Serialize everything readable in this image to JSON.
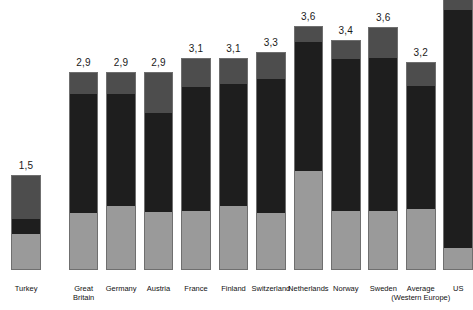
{
  "chart_data": {
    "type": "bar",
    "subtype": "stacked-bar",
    "title": "",
    "subtitle": "",
    "xlabel": "",
    "ylabel": "",
    "grid": false,
    "legend": false,
    "decimal_separator": ",",
    "categories": [
      "Turkey",
      "Great Britain",
      "Germany",
      "Austria",
      "France",
      "Finland",
      "Switzerland",
      "Netherlands",
      "Norway",
      "Sweden",
      "Average (Western Europe)",
      "US"
    ],
    "series": [
      {
        "name": "bottom-segment",
        "color": "#9a9a9a",
        "values": [
          0.37,
          0.58,
          0.65,
          0.59,
          0.6,
          0.65,
          0.58,
          1.0,
          0.6,
          0.59,
          0.61,
          0.22
        ]
      },
      {
        "name": "middle-segment",
        "color": "#1e1e1e",
        "values": [
          0.15,
          1.19,
          1.12,
          0.97,
          1.3,
          1.23,
          1.34,
          1.29,
          1.35,
          1.41,
          1.21,
          3.5
        ]
      },
      {
        "name": "top-segment",
        "color": "#4d4d4d",
        "values": [
          0.43,
          0.23,
          0.23,
          0.4,
          0.3,
          0.27,
          0.26,
          0.15,
          0.18,
          0.3,
          0.22,
          0.1
        ]
      }
    ],
    "totals": [
      1.5,
      2.9,
      2.9,
      2.9,
      3.1,
      3.1,
      3.3,
      3.6,
      3.4,
      3.6,
      3.2,
      null
    ],
    "value_labels": [
      "1,5",
      "2,9",
      "2,9",
      "2,9",
      "3,1",
      "3,1",
      "3,3",
      "3,6",
      "3,4",
      "3,6",
      "3,2",
      ""
    ]
  },
  "bars": [
    {
      "key": "turkey",
      "label_line1": "Turkey",
      "label_line2": "",
      "value": "1,5",
      "left": 13,
      "width": 34,
      "top": 175,
      "bottom": 270,
      "seg_top_h": 43,
      "seg_mid_h": 15,
      "seg_bot_h": 37,
      "cut": false
    },
    {
      "key": "great-britain",
      "label_line1": "Great",
      "label_line2": "Britain",
      "value": "2,9",
      "left": 79,
      "width": 34,
      "top": 72,
      "bottom": 270,
      "seg_top_h": 21,
      "seg_mid_h": 119,
      "seg_bot_h": 58,
      "cut": false
    },
    {
      "key": "germany",
      "label_line1": "Germany",
      "label_line2": "",
      "value": "2,9",
      "left": 122,
      "width": 34,
      "top": 72,
      "bottom": 270,
      "seg_top_h": 21,
      "seg_mid_h": 112,
      "seg_bot_h": 65,
      "cut": false
    },
    {
      "key": "austria",
      "label_line1": "Austria",
      "label_line2": "",
      "value": "2,9",
      "left": 165,
      "width": 34,
      "top": 72,
      "bottom": 270,
      "seg_top_h": 40,
      "seg_mid_h": 99,
      "seg_bot_h": 59,
      "cut": false
    },
    {
      "key": "france",
      "label_line1": "France",
      "label_line2": "",
      "value": "3,1",
      "left": 208,
      "width": 34,
      "top": 58,
      "bottom": 270,
      "seg_top_h": 28,
      "seg_mid_h": 124,
      "seg_bot_h": 60,
      "cut": false
    },
    {
      "key": "finland",
      "label_line1": "Finland",
      "label_line2": "",
      "value": "3,1",
      "left": 251,
      "width": 34,
      "top": 58,
      "bottom": 270,
      "seg_top_h": 25,
      "seg_mid_h": 122,
      "seg_bot_h": 65,
      "cut": false
    },
    {
      "key": "switzerland",
      "label_line1": "Switzerland",
      "label_line2": "",
      "value": "3,3",
      "left": 294,
      "width": 34,
      "top": 52,
      "bottom": 270,
      "seg_top_h": 26,
      "seg_mid_h": 134,
      "seg_bot_h": 58,
      "cut": false
    },
    {
      "key": "netherlands",
      "label_line1": "Netherlands",
      "label_line2": "",
      "value": "3,6",
      "left": 337,
      "width": 34,
      "top": 26,
      "bottom": 270,
      "seg_top_h": 15,
      "seg_mid_h": 129,
      "seg_bot_h": 100,
      "cut": false
    },
    {
      "key": "norway",
      "label_line1": "Norway",
      "label_line2": "",
      "value": "3,4",
      "left": 380,
      "width": 34,
      "top": 40,
      "bottom": 270,
      "seg_top_h": 18,
      "seg_mid_h": 152,
      "seg_bot_h": 60,
      "cut": false
    },
    {
      "key": "sweden",
      "label_line1": "Sweden",
      "label_line2": "",
      "value": "3,6",
      "left": 423,
      "width": 34,
      "top": 27,
      "bottom": 270,
      "seg_top_h": 30,
      "seg_mid_h": 153,
      "seg_bot_h": 60,
      "cut": false
    },
    {
      "key": "average-western-europe",
      "label_line1": "Average",
      "label_line2": "(Western Europe)",
      "value": "3,2",
      "left": 466,
      "width": 34,
      "top": 62,
      "bottom": 270,
      "seg_top_h": 23,
      "seg_mid_h": 123,
      "seg_bot_h": 62,
      "cut": false
    },
    {
      "key": "us",
      "label_line1": "US",
      "label_line2": "",
      "value": "",
      "left": 509,
      "width": 34,
      "top": 0,
      "bottom": 270,
      "seg_top_h": 10,
      "seg_mid_h": 238,
      "seg_bot_h": 22,
      "cut": true
    }
  ],
  "layout": {
    "baseline_y": 270,
    "label_row_y": 284,
    "colors": {
      "top_segment": "#4d4d4d",
      "middle_segment": "#1e1e1e",
      "bottom_segment": "#9a9a9a",
      "bar_outline": "#6f6f6f",
      "text": "#111111",
      "background": "#ffffff"
    }
  }
}
